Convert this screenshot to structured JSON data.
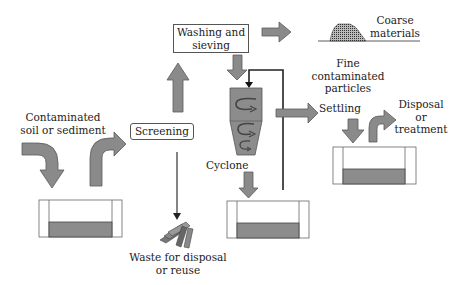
{
  "diagram": {
    "colors": {
      "arrow_fill": "#8a8a8a",
      "arrow_stroke": "#5a5a5a",
      "tank_fill": "#8c8c8c",
      "line": "#222222",
      "box_border": "#555555"
    },
    "nodes": {
      "input": {
        "line1": "Contaminated",
        "line2": "soil or sediment"
      },
      "screening": {
        "label": "Screening"
      },
      "washing": {
        "line1": "Washing and",
        "line2": "sieving"
      },
      "coarse": {
        "line1": "Coarse",
        "line2": "materials"
      },
      "fine": {
        "line1": "Fine",
        "line2": "contaminated",
        "line3": "particles"
      },
      "cyclone": {
        "label": "Cyclone"
      },
      "settling": {
        "label": "Settling"
      },
      "disposal": {
        "line1": "Disposal",
        "line2": "or",
        "line3": "treatment"
      },
      "waste": {
        "line1": "Waste for disposal",
        "line2": "or reuse"
      }
    },
    "edges": [
      {
        "from": "input",
        "to": "tank-1"
      },
      {
        "from": "tank-1",
        "to": "screening"
      },
      {
        "from": "screening",
        "to": "washing"
      },
      {
        "from": "screening",
        "to": "waste"
      },
      {
        "from": "washing",
        "to": "coarse"
      },
      {
        "from": "washing",
        "to": "cyclone"
      },
      {
        "from": "cyclone",
        "to": "settling"
      },
      {
        "from": "cyclone",
        "to": "tank-2"
      },
      {
        "from": "tank-2",
        "to": "cyclone",
        "type": "recycle-line"
      },
      {
        "from": "settling",
        "to": "tank-3"
      },
      {
        "from": "tank-3",
        "to": "disposal"
      }
    ]
  }
}
